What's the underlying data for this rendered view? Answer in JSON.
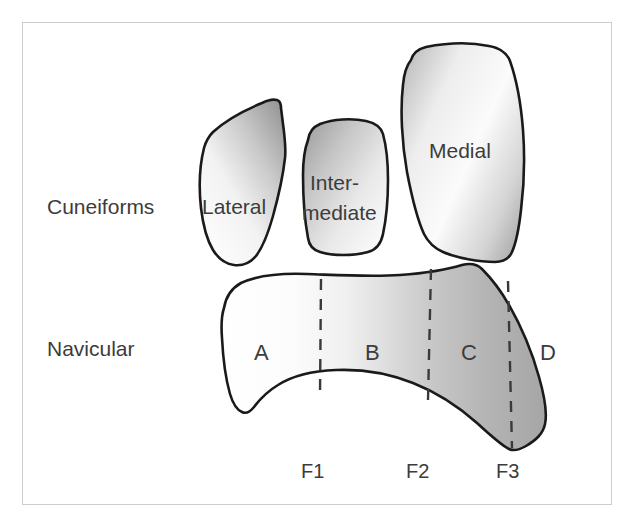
{
  "figure": {
    "border_color": "#cdcdcd",
    "background_color": "#ffffff",
    "outline_color": "#1a1a1a",
    "label_color": "#3c3c3c",
    "divider_color": "#3a3a3a"
  },
  "labels": {
    "group_cuneiforms": "Cuneiforms",
    "bone_navicular": "Navicular"
  },
  "cuneiforms": [
    {
      "id": "lateral",
      "label": "Lateral",
      "label_lines": [
        "Lateral"
      ]
    },
    {
      "id": "intermediate",
      "label": "Intermediate",
      "label_lines": [
        "Inter-",
        "mediate"
      ]
    },
    {
      "id": "medial",
      "label": "Medial",
      "label_lines": [
        "Medial"
      ]
    }
  ],
  "navicular_regions": [
    {
      "id": "region-a",
      "label": "A"
    },
    {
      "id": "region-b",
      "label": "B"
    },
    {
      "id": "region-c",
      "label": "C"
    },
    {
      "id": "region-d",
      "label": "D"
    }
  ],
  "facet_markers": [
    {
      "id": "f1",
      "label": "F1"
    },
    {
      "id": "f2",
      "label": "F2"
    },
    {
      "id": "f3",
      "label": "F3"
    }
  ]
}
